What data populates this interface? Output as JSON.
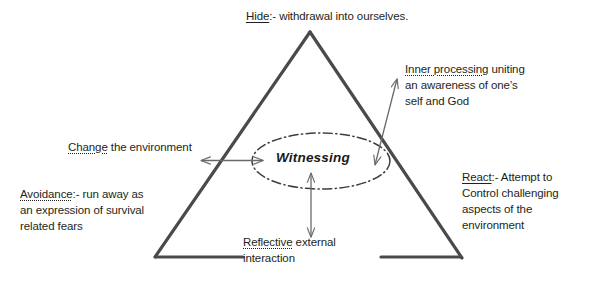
{
  "figure": {
    "background_color": "#ffffff",
    "line_color": "#4a4a4a",
    "text_color": "#231f20"
  },
  "center": {
    "label": "Witnessing",
    "shape": "dash-dot-ellipse"
  },
  "labels": {
    "hide": {
      "emphasis": "Hide",
      "rest": ":- withdrawal into ourselves."
    },
    "inner_processing": {
      "emphasis": "Inner processing",
      "line1_rest": " uniting",
      "line2": "an awareness of one’s",
      "line3": "self and God"
    },
    "change": {
      "emphasis": "Change",
      "rest": " the environment"
    },
    "avoidance": {
      "emphasis": "Avoidance",
      "line1_rest": ":- run away as",
      "line2": "an expression of survival",
      "line3": "related fears"
    },
    "react": {
      "emphasis": "React",
      "line1_rest": ":- Attempt to",
      "line2": "Control challenging",
      "line3": "aspects of the",
      "line4": "environment"
    },
    "reflective": {
      "emphasis": "Reflective",
      "line1_rest": " external",
      "line2": "interaction"
    }
  },
  "shapes": {
    "triangle": {
      "apex": [
        310,
        32
      ],
      "bottom_left": [
        155,
        257
      ],
      "bottom_right": [
        462,
        258
      ]
    },
    "ellipse": {
      "cx": 321,
      "cy": 161,
      "rx": 69,
      "ry": 28
    }
  },
  "arrows": [
    {
      "name": "change-arrow",
      "direction": "double",
      "orientation": "horizontal",
      "from": [
        200,
        160
      ],
      "to": [
        264,
        160
      ]
    },
    {
      "name": "reflective-arrow",
      "direction": "double",
      "orientation": "vertical",
      "from": [
        311,
        172
      ],
      "to": [
        311,
        238
      ]
    },
    {
      "name": "inner-processing-arrow",
      "direction": "double",
      "orientation": "diagonal",
      "from": [
        374,
        166
      ],
      "to": [
        398,
        78
      ]
    }
  ]
}
